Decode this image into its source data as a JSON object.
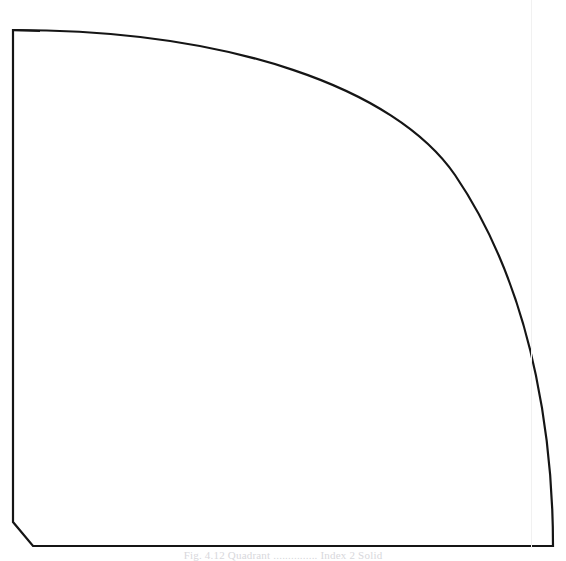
{
  "document": {
    "kind": "scanned-line-drawing",
    "background_color": "#ffffff",
    "ink_color": "#151515",
    "artifact_color": "#f1f1f1",
    "width": 566,
    "height": 561
  },
  "figure": {
    "name": "quarter-ellipse-quadrant",
    "stroke_color": "#151515",
    "stroke_width": 2.2,
    "fill": "none",
    "geometry": {
      "top_left_corner": [
        13,
        30
      ],
      "left_edge_bottom": [
        13,
        522
      ],
      "chamfer_end": [
        33,
        546
      ],
      "bottom_right_corner": [
        553,
        546
      ],
      "arc_start": [
        13,
        30
      ],
      "arc_end": [
        553,
        546
      ],
      "arc_control_points": [
        [
          300,
          85
        ],
        [
          480,
          300
        ]
      ],
      "arc_type": "quarter-ellipse"
    }
  },
  "artifacts": {
    "vertical_scan_line": {
      "label": "faint vertical scan line",
      "x": 531,
      "top": 0,
      "bottom": 548,
      "color": "#f1f1f1"
    }
  },
  "caption": {
    "text": "Fig. 4.12 Quadrant ............... Index 2 Solid",
    "visible": "partially-cropped",
    "color": "#d8d8dc"
  }
}
